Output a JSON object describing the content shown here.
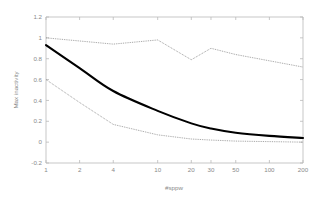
{
  "chart_data": {
    "type": "line",
    "title": "",
    "xlabel": "#sppw",
    "ylabel": "Max inactivity",
    "xscale": "log",
    "xlim": [
      1,
      200
    ],
    "ylim": [
      -0.2,
      1.2
    ],
    "xticks": [
      1,
      2,
      4,
      10,
      20,
      30,
      50,
      100,
      200
    ],
    "xticklabels": [
      "1",
      "2",
      "4",
      "10",
      "20",
      "30",
      "50",
      "100",
      "200"
    ],
    "yticks": [
      -0.2,
      0,
      0.2,
      0.4,
      0.6,
      0.8,
      1,
      1.2
    ],
    "yticklabels": [
      "-0.2",
      "0",
      "0.2",
      "0.4",
      "0.6",
      "0.8",
      "1",
      "1.2"
    ],
    "grid": false,
    "legend": "none",
    "x": [
      1,
      2,
      4,
      10,
      20,
      30,
      50,
      100,
      200
    ],
    "series": [
      {
        "name": "upper bound",
        "style": "dotted",
        "color": "#7d7d7d",
        "values": [
          1.0,
          0.97,
          0.94,
          0.98,
          0.79,
          0.9,
          0.84,
          0.78,
          0.72
        ]
      },
      {
        "name": "mean",
        "style": "solid",
        "color": "#000000",
        "values": [
          0.93,
          0.71,
          0.49,
          0.3,
          0.18,
          0.13,
          0.09,
          0.06,
          0.04
        ]
      },
      {
        "name": "lower bound",
        "style": "dotted",
        "color": "#7d7d7d",
        "values": [
          0.6,
          0.38,
          0.17,
          0.07,
          0.03,
          0.02,
          0.01,
          0.005,
          0.0
        ]
      }
    ]
  }
}
